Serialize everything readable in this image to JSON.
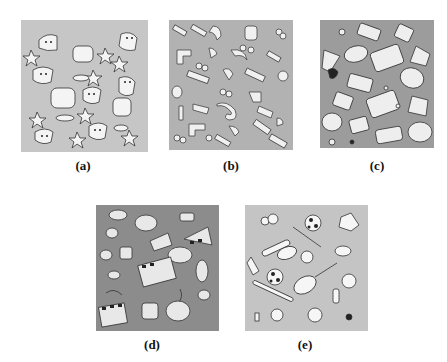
{
  "figure": {
    "panels": [
      {
        "id": "a",
        "label": "(a)",
        "theme": "theater masks, stars and spotlights",
        "bg": "#c6c6c6",
        "box": {
          "x": 21,
          "y": 20,
          "w": 127,
          "h": 132
        },
        "caption": {
          "x": 63,
          "y": 159
        }
      },
      {
        "id": "b",
        "label": "(b)",
        "theme": "3D musical notes and clefs",
        "bg": "#b2b2b2",
        "box": {
          "x": 169,
          "y": 20,
          "w": 124,
          "h": 130
        },
        "caption": {
          "x": 211,
          "y": 159
        }
      },
      {
        "id": "c",
        "label": "(c)",
        "theme": "office and computer objects",
        "bg": "#9c9c9c",
        "box": {
          "x": 320,
          "y": 20,
          "w": 114,
          "h": 128
        },
        "caption": {
          "x": 357,
          "y": 159
        }
      },
      {
        "id": "d",
        "label": "(d)",
        "theme": "film clapboards, reels, megaphone and ribbons",
        "bg": "#8c8c8c",
        "box": {
          "x": 96,
          "y": 205,
          "w": 123,
          "h": 126
        },
        "caption": {
          "x": 132,
          "y": 338
        }
      },
      {
        "id": "e",
        "label": "(e)",
        "theme": "sports balls, rackets and equipment",
        "bg": "#c4c4c4",
        "box": {
          "x": 245,
          "y": 205,
          "w": 123,
          "h": 126
        },
        "caption": {
          "x": 285,
          "y": 338
        }
      }
    ]
  }
}
